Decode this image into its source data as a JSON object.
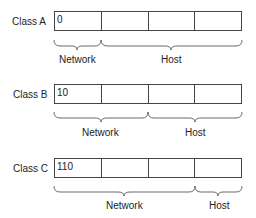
{
  "diagram": {
    "classes": [
      {
        "label": "Class A",
        "prefix": "0",
        "network_label": "Network",
        "host_label": "Host",
        "network_octets": 1,
        "host_octets": 3
      },
      {
        "label": "Class B",
        "prefix": "10",
        "network_label": "Network",
        "host_label": "Host",
        "network_octets": 2,
        "host_octets": 2
      },
      {
        "label": "Class C",
        "prefix": "110",
        "network_label": "Network",
        "host_label": "Host",
        "network_octets": 3,
        "host_octets": 1
      }
    ]
  }
}
